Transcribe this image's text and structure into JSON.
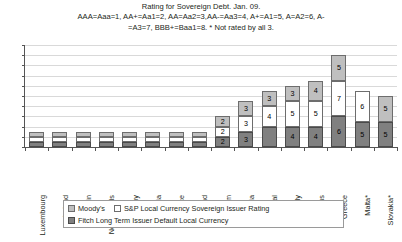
{
  "chart_data": {
    "type": "bar",
    "stacked": true,
    "title": "Rating for Sovereign Debt. Jan. 09.",
    "subtitle_line1": "AAA=Aaa=1, AA+=Aa1=2, AA=Aa2=3,AA-=Aa3=4, A+=A1=5, A=A2=6, A-",
    "subtitle_line2": "=A3=7, BBB+=Baa1=8. * Not rated by all 3.",
    "xlabel": "",
    "ylabel": "",
    "ylim": [
      0,
      20
    ],
    "yticks": [
      0,
      2,
      4,
      6,
      8,
      10,
      12,
      14,
      16,
      18,
      20
    ],
    "grid": true,
    "legend_position": "bottom",
    "categories": [
      "Luxembourg",
      "Ireland",
      "Spain",
      "Netherlands",
      "Germany",
      "Austria",
      "France",
      "Finland",
      "Belgium",
      "Slovenia",
      "Portugal",
      "Italy",
      "Cyprus",
      "Greece",
      "Malta*",
      "Slovakia*"
    ],
    "series": [
      {
        "name": "Moody's",
        "color": "#bfbfbf",
        "values": [
          1,
          1,
          1,
          1,
          1,
          1,
          1,
          1,
          2,
          3,
          3,
          3,
          4,
          5,
          null,
          5
        ],
        "labels": [
          "",
          "",
          "",
          "",
          "",
          "",
          "",
          "",
          "2",
          "3",
          "3",
          "3",
          "4",
          "5",
          "",
          "5"
        ]
      },
      {
        "name": "S&P Local Currency Sovereign Issuer Rating",
        "color": "#ffffff",
        "values": [
          1,
          1,
          1,
          1,
          1,
          1,
          1,
          1,
          2,
          3,
          4,
          5,
          5,
          7,
          6,
          null
        ],
        "labels": [
          "",
          "",
          "",
          "",
          "",
          "",
          "",
          "",
          "2",
          "3",
          "4",
          "5",
          "5",
          "7",
          "6",
          ""
        ]
      },
      {
        "name": "Fitch Long Term Issuer Default Local Currency",
        "color": "#808080",
        "values": [
          1,
          1,
          1,
          1,
          1,
          1,
          1,
          1,
          2,
          3,
          4,
          4,
          4,
          6,
          5,
          5
        ],
        "labels": [
          "",
          "",
          "",
          "",
          "",
          "",
          "",
          "",
          "2",
          "3",
          "",
          "4",
          "4",
          "6",
          "5",
          "5"
        ]
      }
    ],
    "stack_order": [
      "Fitch Long Term Issuer Default Local Currency",
      "S&P Local Currency Sovereign Issuer Rating",
      "Moody's"
    ]
  },
  "legend": {
    "moodys": "Moody's",
    "sp": "S&P Local Currency Sovereign Issuer Rating",
    "fitch": "Fitch Long Term Issuer Default Local Currency"
  }
}
